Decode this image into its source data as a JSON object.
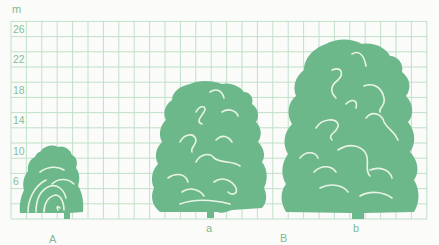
{
  "figure": {
    "unit_label": "m",
    "y_axis_ticks": [
      "26",
      "22",
      "18",
      "14",
      "10",
      "6"
    ],
    "trees": [
      {
        "id": "A",
        "label": "",
        "height_m": 11,
        "caption": "small young tree"
      },
      {
        "id": "a",
        "label": "a",
        "height_m": 18
      },
      {
        "id": "b",
        "label": "b",
        "height_m": 24
      }
    ],
    "group_labels": {
      "left": "A",
      "right": "B"
    },
    "colors": {
      "grid": "#bfe0c8",
      "tree": "#6db88a",
      "highlight": "#e9f4e6",
      "text": "#7fb993"
    }
  }
}
